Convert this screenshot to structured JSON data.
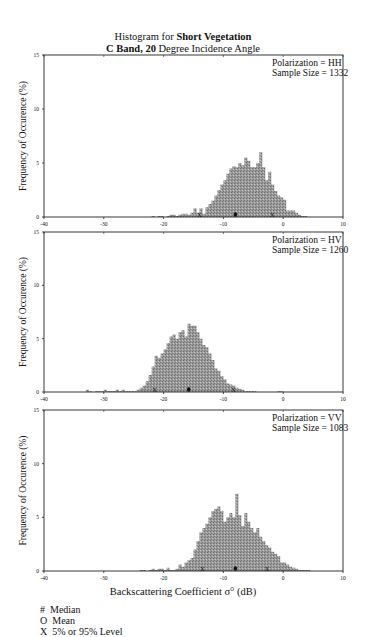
{
  "title": {
    "line1_prefix": "Histogram for ",
    "line1_bold": "Short Vegetation",
    "line2_bold": "C Band, 20",
    "line2_suffix": " Degree Incidence Angle"
  },
  "xlabel": "Backscattering Coefficient  σ° (dB)",
  "ylabel": "Frequency of Occurence (%)",
  "legend": [
    {
      "symbol": "#",
      "label": "Median"
    },
    {
      "symbol": "O",
      "label": "Mean"
    },
    {
      "symbol": "X",
      "label": "5% or 95% Level"
    }
  ],
  "chart_data": [
    {
      "type": "bar",
      "title": "Histogram for Short Vegetation, C Band, 20 Degree Incidence Angle",
      "annotation": [
        "Polarization = HH",
        "Sample Size =  1332"
      ],
      "polarization": "HH",
      "sample_size": 1332,
      "xlabel": "Backscattering Coefficient σ° (dB)",
      "ylabel": "Frequency of Occurence (%)",
      "xlim": [
        -40,
        10
      ],
      "ylim": [
        0,
        15
      ],
      "xticks": [
        -40,
        -30,
        -20,
        -10,
        0,
        10
      ],
      "yticks": [
        0,
        5,
        10,
        15
      ],
      "bin_width_db": 0.5,
      "bin_start_db": -22,
      "values": [
        0.1,
        0,
        0.1,
        0.1,
        0,
        0.1,
        0.2,
        0.2,
        0.1,
        0.2,
        0.3,
        0.3,
        0.2,
        0.4,
        0.8,
        0.4,
        0.8,
        0.3,
        0.9,
        1.2,
        1.5,
        2.0,
        2.5,
        3.0,
        3.4,
        4.0,
        4.5,
        4.7,
        4.6,
        5.0,
        4.8,
        5.5,
        5.2,
        4.6,
        4.6,
        5.0,
        6.0,
        4.6,
        3.4,
        4.2,
        3.0,
        2.4,
        2.0,
        1.8,
        1.6,
        0.6,
        0.6,
        0.6,
        0.4,
        0.2,
        0.1,
        0.1
      ],
      "markers": {
        "mean": -8.0,
        "p5": -14.0,
        "p95": -1.8
      }
    },
    {
      "type": "bar",
      "annotation": [
        "Polarization = HV",
        "Sample Size =  1260"
      ],
      "polarization": "HV",
      "sample_size": 1260,
      "xlabel": "Backscattering Coefficient σ° (dB)",
      "ylabel": "Frequency of Occurence (%)",
      "xlim": [
        -40,
        10
      ],
      "ylim": [
        0,
        15
      ],
      "xticks": [
        -40,
        -30,
        -20,
        -10,
        0,
        10
      ],
      "yticks": [
        0,
        5,
        10,
        15
      ],
      "bin_width_db": 0.5,
      "bin_start_db": -33,
      "values": [
        0.2,
        0.1,
        0,
        0.1,
        0.1,
        0.1,
        0.2,
        0.1,
        0.1,
        0.1,
        0.2,
        0.1,
        0.2,
        0.1,
        0.1,
        0.1,
        0.1,
        0.2,
        0.4,
        0.6,
        1.0,
        1.6,
        2.4,
        3.4,
        3.2,
        3.6,
        4.0,
        4.6,
        5.2,
        5.4,
        5.0,
        5.6,
        5.8,
        5.2,
        6.4,
        6.2,
        6.2,
        5.6,
        5.0,
        4.4,
        4.2,
        3.6,
        3.0,
        2.2,
        2.0,
        1.5,
        1.2,
        0.8,
        0.7,
        0.6,
        0.4,
        0.3,
        0.2,
        0.1,
        0.1,
        0.1,
        0.1,
        0,
        0,
        0,
        0,
        0,
        0,
        0,
        0.1,
        0.1
      ],
      "markers": {
        "mean": -15.8,
        "p5": -21.5,
        "p95": -8.3
      }
    },
    {
      "type": "bar",
      "annotation": [
        "Polarization = VV",
        "Sample Size =  1083"
      ],
      "polarization": "VV",
      "sample_size": 1083,
      "xlabel": "Backscattering Coefficient σ° (dB)",
      "ylabel": "Frequency of Occurence (%)",
      "xlim": [
        -40,
        10
      ],
      "ylim": [
        0,
        15
      ],
      "xticks": [
        -40,
        -30,
        -20,
        -10,
        0,
        10
      ],
      "yticks": [
        0,
        5,
        10,
        15
      ],
      "bin_width_db": 0.5,
      "bin_start_db": -24,
      "values": [
        0.1,
        0.1,
        0,
        0.1,
        0.2,
        0.1,
        0.2,
        0.2,
        0.1,
        0.3,
        0.1,
        0.1,
        0.2,
        0.6,
        0.4,
        0.8,
        1.0,
        1.2,
        2.0,
        2.8,
        3.6,
        4.0,
        4.4,
        5.0,
        5.6,
        5.8,
        6.0,
        5.6,
        4.6,
        5.0,
        5.4,
        5.0,
        7.2,
        5.2,
        4.2,
        5.4,
        4.6,
        4.0,
        3.6,
        4.0,
        3.2,
        2.8,
        2.4,
        2.2,
        1.8,
        1.6,
        1.4,
        0.8,
        0.8,
        0.6,
        0.4,
        0.3,
        0.2,
        0.1,
        0.1,
        0.1,
        0.1
      ],
      "markers": {
        "mean": -8.0,
        "p5": -13.5,
        "p95": -2.7
      }
    }
  ]
}
